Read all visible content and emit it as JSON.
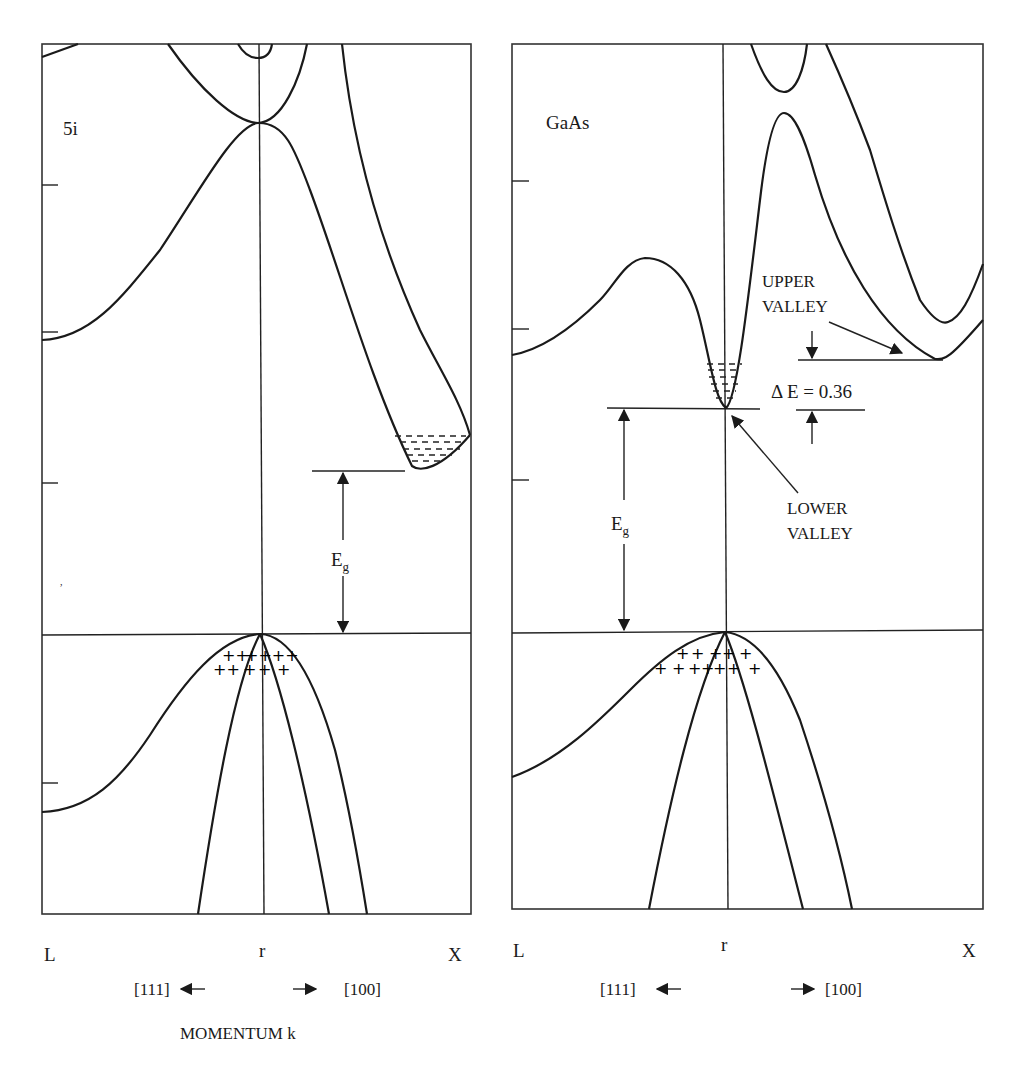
{
  "panels": [
    {
      "material": "5i",
      "gap_label": "E",
      "gap_subscript": "g",
      "x_labels": {
        "left": "L",
        "center": "r",
        "right": "X"
      },
      "directions": {
        "left": "[111]",
        "right": "[100]"
      }
    },
    {
      "material": "GaAs",
      "gap_label": "E",
      "gap_subscript": "g",
      "x_labels": {
        "left": "L",
        "center": "r",
        "right": "X"
      },
      "directions": {
        "left": "[111]",
        "right": "[100]"
      },
      "annotations": {
        "upper_valley_line1": "UPPER",
        "upper_valley_line2": "VALLEY",
        "delta_e": "Δ E = 0.36",
        "lower_valley_line1": "LOWER",
        "lower_valley_line2": "VALLEY"
      }
    }
  ],
  "x_axis_title": "MOMENTUM k",
  "symbols": {
    "hole": "+",
    "electron": "-"
  }
}
